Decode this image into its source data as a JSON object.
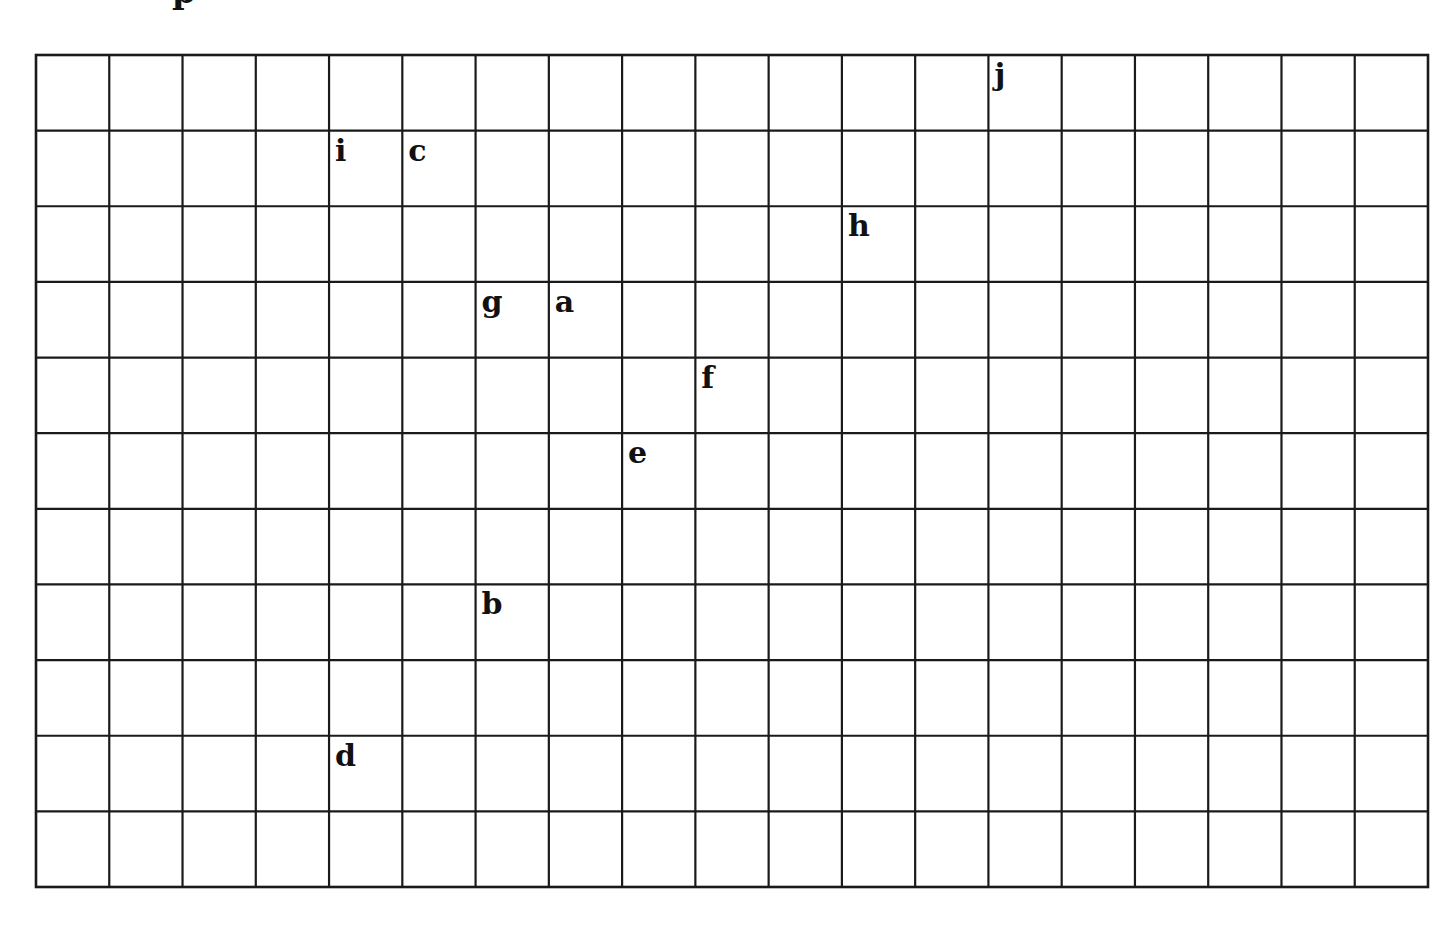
{
  "page": {
    "cropped_heading_glyph": "p"
  },
  "grid": {
    "columns": 19,
    "rows": 11,
    "line_color": "#1a1a1a",
    "background": "#ffffff",
    "labels": [
      {
        "letter": "a",
        "col": 7,
        "row": 3
      },
      {
        "letter": "b",
        "col": 6,
        "row": 7
      },
      {
        "letter": "c",
        "col": 5,
        "row": 1
      },
      {
        "letter": "d",
        "col": 4,
        "row": 9
      },
      {
        "letter": "e",
        "col": 8,
        "row": 5
      },
      {
        "letter": "f",
        "col": 9,
        "row": 4
      },
      {
        "letter": "g",
        "col": 6,
        "row": 3
      },
      {
        "letter": "h",
        "col": 11,
        "row": 2
      },
      {
        "letter": "i",
        "col": 4,
        "row": 1
      },
      {
        "letter": "j",
        "col": 13,
        "row": 0
      }
    ]
  }
}
